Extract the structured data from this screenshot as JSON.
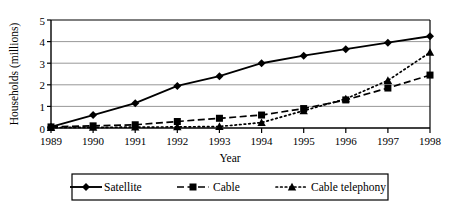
{
  "chart_data": {
    "type": "line",
    "title": "",
    "xlabel": "Year",
    "ylabel": "Households (millions)",
    "categories": [
      "1989",
      "1990",
      "1991",
      "1992",
      "1993",
      "1994",
      "1995",
      "1996",
      "1997",
      "1998"
    ],
    "x": [
      1989,
      1990,
      1991,
      1992,
      1993,
      1994,
      1995,
      1996,
      1997,
      1998
    ],
    "xlim": [
      1989,
      1998
    ],
    "ylim": [
      0,
      5
    ],
    "yticks": [
      0,
      1,
      2,
      3,
      4,
      5
    ],
    "ytick_labels": [
      "0",
      "1",
      "2",
      "3",
      "4",
      "5"
    ],
    "grid": "horizontal",
    "legend_position": "bottom",
    "series": [
      {
        "name": "Satellite",
        "marker": "diamond",
        "linestyle": "solid",
        "color": "#000000",
        "values": [
          0.05,
          0.6,
          1.15,
          1.95,
          2.4,
          3.0,
          3.35,
          3.65,
          3.95,
          4.25
        ]
      },
      {
        "name": "Cable",
        "marker": "square",
        "linestyle": "dashed",
        "color": "#000000",
        "values": [
          0.05,
          0.1,
          0.15,
          0.3,
          0.45,
          0.6,
          0.9,
          1.3,
          1.85,
          2.45
        ]
      },
      {
        "name": "Cable telephony",
        "marker": "triangle",
        "linestyle": "dotted",
        "color": "#000000",
        "values": [
          0.02,
          0.03,
          0.04,
          0.05,
          0.07,
          0.25,
          0.8,
          1.35,
          2.2,
          3.5
        ]
      }
    ]
  },
  "legend": {
    "entries": [
      {
        "label": "Satellite"
      },
      {
        "label": "Cable"
      },
      {
        "label": "Cable telephony"
      }
    ]
  },
  "colors": {
    "ink": "#000000",
    "background": "#ffffff",
    "gridline": "#8c8c8c"
  }
}
